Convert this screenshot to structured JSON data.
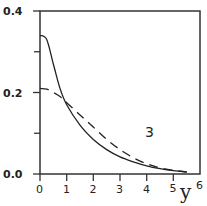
{
  "chart_data": {
    "type": "line",
    "title": "",
    "xlabel": "y",
    "ylabel": "",
    "xlim": [
      0,
      6
    ],
    "ylim": [
      0,
      0.4
    ],
    "grid": false,
    "x_ticks": [
      "0",
      "1",
      "2",
      "3",
      "4",
      "5",
      "6"
    ],
    "y_ticks": [
      "0.0",
      "0.2",
      "0.4"
    ],
    "annotations": [
      {
        "text": "3",
        "x": 4.1,
        "y": 0.1
      }
    ],
    "x": [
      0,
      0.25,
      0.5,
      0.75,
      1,
      1.5,
      2,
      2.5,
      3,
      3.5,
      4,
      4.5,
      5,
      5.5
    ],
    "series": [
      {
        "name": "solid",
        "style": "solid",
        "values": [
          0.34,
          0.33,
          0.27,
          0.21,
          0.17,
          0.12,
          0.085,
          0.06,
          0.042,
          0.03,
          0.02,
          0.013,
          0.008,
          0.005
        ]
      },
      {
        "name": "dashed",
        "style": "dashed",
        "values": [
          0.21,
          0.208,
          0.2,
          0.19,
          0.175,
          0.145,
          0.115,
          0.085,
          0.06,
          0.04,
          0.025,
          0.015,
          0.009,
          0.005
        ]
      }
    ]
  },
  "labels": {
    "y_0": "0.0",
    "y_2": "0.2",
    "y_4": "0.4",
    "x_0": "0",
    "x_1": "1",
    "x_2": "2",
    "x_3": "3",
    "x_4": "4",
    "x_5": "5",
    "x_6": "6",
    "x_var": "y",
    "curve": "3"
  }
}
